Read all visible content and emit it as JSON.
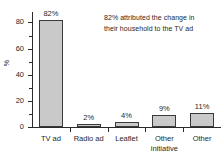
{
  "chart_data": {
    "type": "bar",
    "title": "",
    "subtitle": "",
    "xlabel": "",
    "ylabel": "%",
    "categories": [
      "TV ad",
      "Radio ad",
      "Leaflet",
      "Other initiative",
      "Other"
    ],
    "values": [
      82,
      2,
      4,
      9,
      11
    ],
    "data_labels": [
      "82%",
      "2%",
      "4%",
      "9%",
      "11%"
    ],
    "ylim": [
      0,
      88
    ],
    "yticks": [
      0,
      20,
      40,
      60,
      80
    ],
    "ytick_labels": [
      "0",
      "20",
      "40",
      "60",
      "80"
    ],
    "yminor_ticks": [
      10,
      30,
      50,
      70
    ],
    "grid": false,
    "legend": null,
    "annotations": [
      {
        "line1": "82% attributed the change in",
        "line2": "their household to the TV ad"
      }
    ],
    "colors": {
      "bar_fill": "#c9c9c9",
      "bar_border": "#3a3a3a",
      "axis": "#2b2b2b",
      "text": "#1f1f1f",
      "background": "#ffffff"
    }
  },
  "category_label_lines": [
    [
      "TV ad"
    ],
    [
      "Radio ad"
    ],
    [
      "Leaflet"
    ],
    [
      "Other",
      "initiative"
    ],
    [
      "Other"
    ]
  ]
}
